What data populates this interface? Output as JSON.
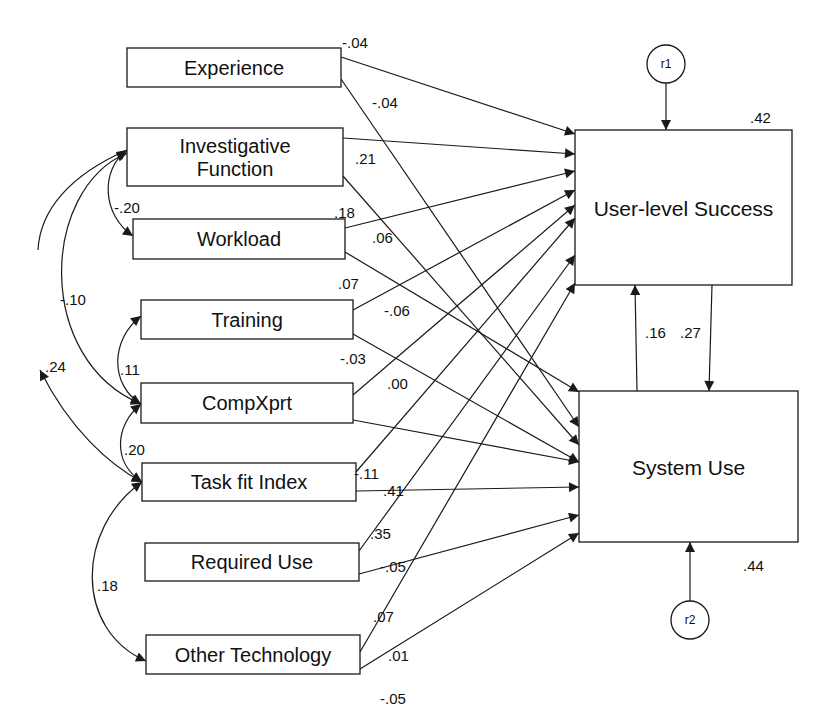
{
  "diagram": {
    "type": "path-model",
    "exogenous": [
      {
        "id": "experience",
        "label_lines": [
          "Experience"
        ],
        "x": 127,
        "y": 48,
        "w": 214,
        "h": 39
      },
      {
        "id": "investigative",
        "label_lines": [
          "Investigative",
          "Function"
        ],
        "x": 127,
        "y": 128,
        "w": 216,
        "h": 58
      },
      {
        "id": "workload",
        "label_lines": [
          "Workload"
        ],
        "x": 133,
        "y": 219,
        "w": 212,
        "h": 40
      },
      {
        "id": "training",
        "label_lines": [
          "Training"
        ],
        "x": 141,
        "y": 300,
        "w": 212,
        "h": 39
      },
      {
        "id": "compxprt",
        "label_lines": [
          "CompXprt"
        ],
        "x": 141,
        "y": 383,
        "w": 212,
        "h": 40
      },
      {
        "id": "taskfit",
        "label_lines": [
          "Task fit Index"
        ],
        "x": 142,
        "y": 463,
        "w": 214,
        "h": 38
      },
      {
        "id": "requireduse",
        "label_lines": [
          "Required Use"
        ],
        "x": 145,
        "y": 543,
        "w": 214,
        "h": 38
      },
      {
        "id": "othertech",
        "label_lines": [
          "Other Technology"
        ],
        "x": 146,
        "y": 635,
        "w": 214,
        "h": 39
      }
    ],
    "endogenous": [
      {
        "id": "uls",
        "label": "User-level Success",
        "x": 575,
        "y": 130,
        "w": 217,
        "h": 155,
        "r2": ".42",
        "r2_pos": [
          750,
          123
        ]
      },
      {
        "id": "su",
        "label": "System Use",
        "x": 579,
        "y": 391,
        "w": 219,
        "h": 151,
        "r2": ".44",
        "r2_pos": [
          743,
          571
        ]
      }
    ],
    "residuals": [
      {
        "id": "r1",
        "label": "r1",
        "cx": 666,
        "cy": 64,
        "r": 19,
        "to": [
          666,
          130
        ]
      },
      {
        "id": "r2",
        "label": "r2",
        "cx": 690,
        "cy": 620,
        "r": 19,
        "to": [
          690,
          542
        ]
      }
    ],
    "paths": [
      {
        "from": "Experience",
        "to": "User-level Success",
        "x1": 341,
        "y1": 57,
        "x2": 575,
        "y2": 134,
        "coef": "-.04",
        "lx": 342,
        "ly": 48
      },
      {
        "from": "Experience",
        "to": "System Use",
        "x1": 341,
        "y1": 79,
        "x2": 579,
        "y2": 427,
        "coef": "-.04",
        "lx": 372,
        "ly": 108
      },
      {
        "from": "Investigative Function",
        "to": "User-level Success",
        "x1": 343,
        "y1": 138,
        "x2": 575,
        "y2": 154,
        "coef": ".21",
        "lx": 355,
        "ly": 164
      },
      {
        "from": "Investigative Function",
        "to": "System Use",
        "x1": 343,
        "y1": 176,
        "x2": 579,
        "y2": 445,
        "coef": ".06",
        "lx": 372,
        "ly": 243
      },
      {
        "from": "Workload",
        "to": "User-level Success",
        "x1": 345,
        "y1": 228,
        "x2": 575,
        "y2": 171,
        "coef": ".18",
        "lx": 334,
        "ly": 218
      },
      {
        "from": "Workload",
        "to": "System Use",
        "x1": 345,
        "y1": 252,
        "x2": 579,
        "y2": 392,
        "coef": "-.06",
        "lx": 384,
        "ly": 316
      },
      {
        "from": "Training",
        "to": "User-level Success",
        "x1": 353,
        "y1": 310,
        "x2": 575,
        "y2": 190,
        "coef": ".07",
        "lx": 338,
        "ly": 289
      },
      {
        "from": "Training",
        "to": "System Use",
        "x1": 353,
        "y1": 334,
        "x2": 579,
        "y2": 462,
        "coef": "-.03",
        "lx": 340,
        "ly": 364
      },
      {
        "from": "CompXprt",
        "to": "User-level Success",
        "x1": 353,
        "y1": 395,
        "x2": 575,
        "y2": 205,
        "coef": ".00",
        "lx": 387,
        "ly": 389
      },
      {
        "from": "CompXprt",
        "to": "System Use",
        "x1": 353,
        "y1": 420,
        "x2": 579,
        "y2": 462,
        "coef": "",
        "lx": 0,
        "ly": 0
      },
      {
        "from": "Task fit Index",
        "to": "User-level Success",
        "x1": 356,
        "y1": 472,
        "x2": 575,
        "y2": 218,
        "coef": "-.11",
        "lx": 354,
        "ly": 479
      },
      {
        "from": "Task fit Index",
        "to": "System Use",
        "x1": 356,
        "y1": 491,
        "x2": 579,
        "y2": 487,
        "coef": ".41",
        "lx": 383,
        "ly": 496
      },
      {
        "from": "Required Use",
        "to": "User-level Success",
        "x1": 359,
        "y1": 551,
        "x2": 575,
        "y2": 255,
        "coef": ".35",
        "lx": 370,
        "ly": 539
      },
      {
        "from": "Required Use",
        "to": "System Use",
        "x1": 359,
        "y1": 574,
        "x2": 579,
        "y2": 515,
        "coef": "-.05",
        "lx": 380,
        "ly": 572
      },
      {
        "from": "Other Technology",
        "to": "User-level Success",
        "x1": 360,
        "y1": 652,
        "x2": 575,
        "y2": 283,
        "coef": ".07",
        "lx": 373,
        "ly": 622
      },
      {
        "from": "Other Technology",
        "to": "System Use",
        "x1": 360,
        "y1": 669,
        "x2": 579,
        "y2": 533,
        "coef": ".01",
        "lx": 388,
        "ly": 661
      },
      {
        "from": "Other Technology",
        "to": "(label)",
        "x1": 0,
        "y1": 0,
        "x2": 0,
        "y2": 0,
        "coef": "-.05",
        "lx": 380,
        "ly": 704
      }
    ],
    "reciprocal": [
      {
        "from": "System Use",
        "to": "User-level Success",
        "x1": 637,
        "y1": 391,
        "x2": 635,
        "y2": 285,
        "coef": ".16",
        "lx": 645,
        "ly": 338
      },
      {
        "from": "User-level Success",
        "to": "System Use",
        "x1": 712,
        "y1": 285,
        "x2": 709,
        "y2": 391,
        "coef": ".27",
        "lx": 680,
        "ly": 338
      }
    ],
    "covariances": [
      {
        "between": [
          "Investigative Function",
          "Workload"
        ],
        "d": "M127,150 C100,170 102,215 133,236",
        "coef": "-.20",
        "lx": 114,
        "ly": 213
      },
      {
        "between": [
          "Investigative Function",
          "CompXprt"
        ],
        "d": "M127,153 C40,190 35,360 141,404",
        "coef": "-.10",
        "lx": 60,
        "ly": 305
      },
      {
        "between": [
          "Investigative Function",
          "Task fit Index"
        ],
        "d": "M127,150 C70,175 40,210 38,250",
        "coef": "",
        "lx": 0,
        "ly": 0
      },
      {
        "between": [
          "CompXprt",
          "Task fit Index"
        ],
        "d": "M40,370 C70,430 110,465 142,482",
        "coef": ".24",
        "lx": 45,
        "ly": 372
      },
      {
        "between": [
          "Training",
          "CompXprt"
        ],
        "d": "M141,316 C110,340 110,385 141,404",
        "coef": ".11",
        "lx": 120,
        "ly": 375
      },
      {
        "between": [
          "CompXprt",
          "Task fit Index"
        ],
        "d": "M141,404 C115,425 112,462 142,482",
        "coef": ".20",
        "lx": 124,
        "ly": 455
      },
      {
        "between": [
          "Task fit Index",
          "Other Technology"
        ],
        "d": "M142,482 C75,530 75,630 146,661",
        "coef": ".18",
        "lx": 97,
        "ly": 591
      }
    ]
  }
}
